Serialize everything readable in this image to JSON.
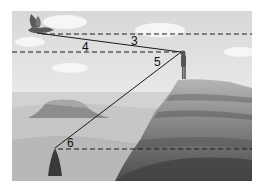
{
  "figure": {
    "angle_labels": {
      "a3": "3",
      "a4": "4",
      "a5": "5",
      "a6": "6"
    },
    "objects": [
      "bird",
      "person",
      "tree",
      "cliff",
      "mesa"
    ],
    "colors": {
      "sky": "#e4e4e4",
      "line": "#1a1a1a",
      "ground": "#bdbdbd",
      "cliff": "#7a7a7a"
    }
  }
}
